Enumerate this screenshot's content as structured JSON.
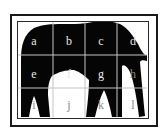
{
  "figure": {
    "grid": {
      "columns": 4,
      "rows": 3,
      "cells": [
        {
          "label": "a",
          "x": 34,
          "y": 42,
          "tone": "on-dark"
        },
        {
          "label": "b",
          "x": 69,
          "y": 42,
          "tone": "on-dark"
        },
        {
          "label": "c",
          "x": 101,
          "y": 42,
          "tone": "on-dark"
        },
        {
          "label": "d",
          "x": 133,
          "y": 42,
          "tone": "on-dark"
        },
        {
          "label": "e",
          "x": 34,
          "y": 75,
          "tone": "on-dark"
        },
        {
          "label": "f",
          "x": 69,
          "y": 75,
          "tone": "on-dark"
        },
        {
          "label": "g",
          "x": 101,
          "y": 75,
          "tone": "on-dark"
        },
        {
          "label": "h",
          "x": 133,
          "y": 75,
          "tone": "on-light"
        },
        {
          "label": "i",
          "x": 34,
          "y": 106,
          "tone": "on-light"
        },
        {
          "label": "j",
          "x": 69,
          "y": 106,
          "tone": "on-light"
        },
        {
          "label": "k",
          "x": 101,
          "y": 106,
          "tone": "on-light"
        },
        {
          "label": "l",
          "x": 133,
          "y": 106,
          "tone": "on-light"
        }
      ]
    },
    "colors": {
      "silhouette": "#050505",
      "background": "#ffffff",
      "grid_line": "#bdbdbd",
      "frame": "#1a1a1a"
    }
  }
}
